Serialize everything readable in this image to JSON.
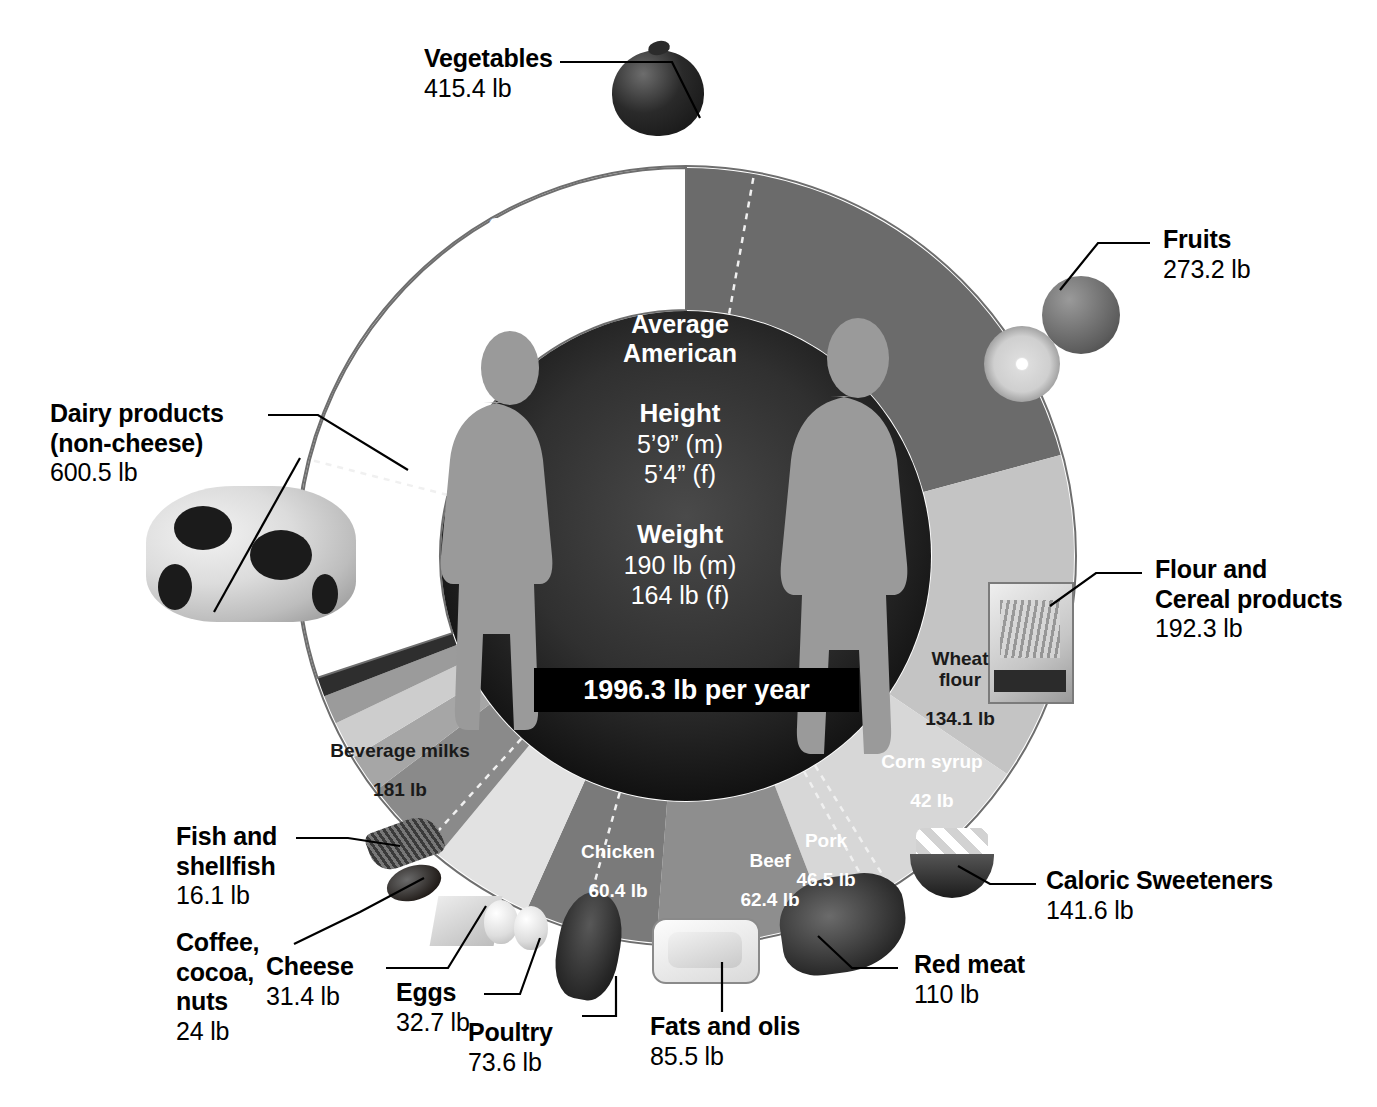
{
  "chart_data": {
    "type": "pie",
    "total_label": "1996.3 lb per year",
    "total_value": 1996.3,
    "units": "lb",
    "legend_position": "callouts around ring",
    "grid": false,
    "categories": [
      "Vegetables",
      "Fruits",
      "Flour and Cereal products",
      "Caloric Sweeteners",
      "Red meat",
      "Fats and olis",
      "Poultry",
      "Eggs",
      "Cheese",
      "Coffee, cocoa, nuts",
      "Fish and shellfish",
      "Dairy products (non-cheese)"
    ],
    "values": [
      415.4,
      273.2,
      192.3,
      141.6,
      110,
      85.5,
      73.6,
      32.7,
      31.4,
      24,
      16.1,
      600.5
    ],
    "sub_categories": [
      "Corn",
      "Wheat flour",
      "Corn syrup",
      "Beef",
      "Pork",
      "Chicken",
      "Beverage milks"
    ],
    "sub_values": [
      56,
      134.1,
      42,
      62.4,
      46.5,
      60.4,
      181
    ]
  },
  "hub": {
    "title": "Average\nAmerican",
    "height_label": "Height",
    "height_value": "5’9” (m)\n5’4” (f)",
    "weight_label": "Weight",
    "weight_value": "190 lb (m)\n164 lb (f)",
    "total_banner": "1996.3 lb per year"
  },
  "segments": [
    {
      "key": "vegetables",
      "name": "Vegetables",
      "value": "415.4 lb",
      "amount": 415.4,
      "color": "#6b6b6b"
    },
    {
      "key": "fruits",
      "name": "Fruits",
      "value": "273.2 lb",
      "amount": 273.2,
      "color": "#c4c4c4"
    },
    {
      "key": "flour",
      "name": "Flour and\nCereal products",
      "value": "192.3 lb",
      "amount": 192.3,
      "color": "#d7d7d7"
    },
    {
      "key": "sweeteners",
      "name": "Caloric Sweeteners",
      "value": "141.6 lb",
      "amount": 141.6,
      "color": "#8e8e8e"
    },
    {
      "key": "redmeat",
      "name": "Red meat",
      "value": "110 lb",
      "amount": 110.0,
      "color": "#7a7a7a"
    },
    {
      "key": "fats",
      "name": "Fats and olis",
      "value": "85.5 lb",
      "amount": 85.5,
      "color": "#e2e2e2"
    },
    {
      "key": "poultry",
      "name": "Poultry",
      "value": "73.6 lb",
      "amount": 73.6,
      "color": "#8a8a8a"
    },
    {
      "key": "eggs",
      "name": "Eggs",
      "value": "32.7 lb",
      "amount": 32.7,
      "color": "#a6a6a6"
    },
    {
      "key": "cheese",
      "name": "Cheese",
      "value": "31.4 lb",
      "amount": 31.4,
      "color": "#cdcdcd"
    },
    {
      "key": "coffee",
      "name": "Coffee,\ncocoa,\nnuts",
      "value": "24 lb",
      "amount": 24.0,
      "color": "#9b9b9b"
    },
    {
      "key": "fish",
      "name": "Fish and\nshellfish",
      "value": "16.1 lb",
      "amount": 16.1,
      "color": "#2e2e2e"
    },
    {
      "key": "dairy",
      "name": "Dairy products\n(non-cheese)",
      "value": "600.5 lb",
      "amount": 600.5,
      "color": "#ffffff"
    }
  ],
  "ring_labels": [
    {
      "key": "corn",
      "name": "Corn",
      "value": "56 lb",
      "tone": "light"
    },
    {
      "key": "wheatflour",
      "name": "Wheat\nflour",
      "value": "134.1 lb",
      "tone": "dark"
    },
    {
      "key": "cornsyrup",
      "name": "Corn syrup",
      "value": "42 lb",
      "tone": "light"
    },
    {
      "key": "beef",
      "name": "Beef",
      "value": "62.4 lb",
      "tone": "light"
    },
    {
      "key": "pork",
      "name": "Pork",
      "value": "46.5 lb",
      "tone": "light"
    },
    {
      "key": "chicken",
      "name": "Chicken",
      "value": "60.4 lb",
      "tone": "light"
    },
    {
      "key": "bevmilks",
      "name": "Beverage milks",
      "value": "181 lb",
      "tone": "dark"
    }
  ],
  "colors": {
    "hub_outer": "#3d3d3d",
    "hub_inner": "#101010",
    "figure": "#9a9a9a",
    "banner_bg": "#000000",
    "text_on_dark": "#ffffff",
    "text_on_light": "#1a1a1a",
    "leader_line": "#000000",
    "outline": "#6e6e6e"
  }
}
